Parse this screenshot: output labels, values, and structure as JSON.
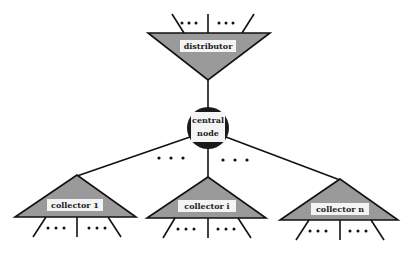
{
  "diagram": {
    "distributor": {
      "label": "distributor"
    },
    "central_node": {
      "label_line1": "central",
      "label_line2": "node"
    },
    "collectors": [
      {
        "label": "collector 1"
      },
      {
        "label": "collector i"
      },
      {
        "label": "collector n"
      }
    ],
    "ellipsis": "• • •",
    "colors": {
      "triangle_fill": "#9a9a9a",
      "node_fill": "#1a1a1a",
      "line": "#111111",
      "label_box": "#f4f4f4"
    }
  }
}
